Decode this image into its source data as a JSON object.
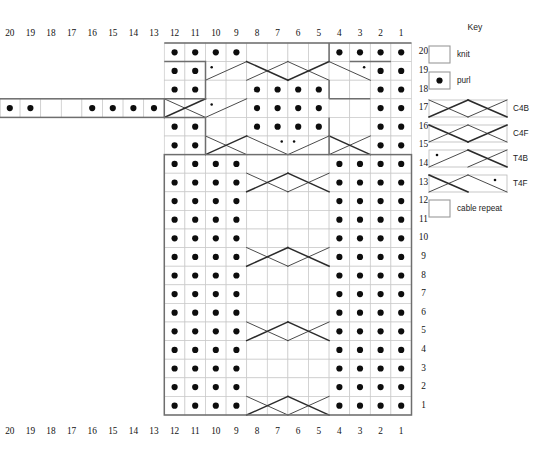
{
  "page": {
    "top_faint_text": "",
    "background": "#ffffff",
    "line_color": "#2b2b2b",
    "grid_color": "#c9c9c9",
    "outline_color": "#6e6e6e",
    "dot_color": "#0d0d0d"
  },
  "chart": {
    "cols": 20,
    "rows": 20,
    "col_labels_top": [
      "20",
      "19",
      "18",
      "17",
      "16",
      "15",
      "14",
      "13",
      "12",
      "11",
      "10",
      "9",
      "8",
      "7",
      "6",
      "5",
      "4",
      "3",
      "2",
      "1"
    ],
    "col_labels_bottom": [
      "20",
      "19",
      "18",
      "17",
      "16",
      "15",
      "14",
      "13",
      "12",
      "11",
      "10",
      "9",
      "8",
      "7",
      "6",
      "5",
      "4",
      "3",
      "2",
      "1"
    ],
    "row_labels": [
      "20",
      "19",
      "18",
      "17",
      "16",
      "15",
      "14",
      "13",
      "12",
      "11",
      "10",
      "9",
      "8",
      "7",
      "6",
      "5",
      "4",
      "3",
      "2",
      "1"
    ],
    "symbols": {
      "knit": "knit",
      "purl": "purl",
      "c4b": "C4B",
      "c4f": "C4F",
      "t4b": "T4B",
      "t4f": "T4F"
    },
    "rows_data": [
      {
        "row": "20",
        "start_col": 12,
        "end_col": 1,
        "cells": [
          "purl",
          "purl",
          "purl",
          "purl",
          "knit",
          "knit",
          "knit",
          "knit",
          "purl",
          "purl",
          "purl",
          "purl"
        ]
      },
      {
        "row": "19",
        "start_col": 12,
        "end_col": 1,
        "cells": [
          "purl",
          "purl",
          "t4b",
          "t4b",
          "c4f",
          "c4f",
          "c4b",
          "c4b",
          "t4f",
          "t4f",
          "purl",
          "purl"
        ]
      },
      {
        "row": "18",
        "start_col": 12,
        "end_col": 1,
        "cells": [
          "purl",
          "purl",
          "knit",
          "knit",
          "purl",
          "purl",
          "purl",
          "purl",
          "knit",
          "knit",
          "purl",
          "purl"
        ]
      },
      {
        "row": "17",
        "start_col": 20,
        "end_col": 1,
        "cells": [
          "purl",
          "purl",
          "knit",
          "knit",
          "purl",
          "purl",
          "purl",
          "purl",
          "c4b",
          "c4b",
          "t4b",
          "t4b",
          "purl",
          "purl",
          "purl",
          "purl",
          "knit",
          "knit",
          "purl",
          "purl"
        ]
      },
      {
        "row": "16",
        "start_col": 12,
        "end_col": 1,
        "cells": [
          "purl",
          "purl",
          "knit",
          "knit",
          "purl",
          "purl",
          "purl",
          "purl",
          "knit",
          "knit",
          "purl",
          "purl"
        ]
      },
      {
        "row": "15",
        "start_col": 12,
        "end_col": 1,
        "cells": [
          "purl",
          "purl",
          "c4b",
          "c4b",
          "t4f",
          "t4f",
          "t4b",
          "t4b",
          "c4f",
          "c4f",
          "purl",
          "purl"
        ]
      },
      {
        "row": "14",
        "start_col": 12,
        "end_col": 1,
        "cells": [
          "purl",
          "purl",
          "purl",
          "purl",
          "knit",
          "knit",
          "knit",
          "knit",
          "purl",
          "purl",
          "purl",
          "purl"
        ]
      },
      {
        "row": "13",
        "start_col": 12,
        "end_col": 1,
        "cells": [
          "purl",
          "purl",
          "purl",
          "purl",
          "c4b",
          "c4b",
          "c4f",
          "c4f",
          "purl",
          "purl",
          "purl",
          "purl"
        ]
      },
      {
        "row": "12",
        "start_col": 12,
        "end_col": 1,
        "cells": [
          "purl",
          "purl",
          "purl",
          "purl",
          "knit",
          "knit",
          "knit",
          "knit",
          "purl",
          "purl",
          "purl",
          "purl"
        ]
      },
      {
        "row": "11",
        "start_col": 12,
        "end_col": 1,
        "cells": [
          "purl",
          "purl",
          "purl",
          "purl",
          "knit",
          "knit",
          "knit",
          "knit",
          "purl",
          "purl",
          "purl",
          "purl"
        ]
      },
      {
        "row": "10",
        "start_col": 12,
        "end_col": 1,
        "cells": [
          "purl",
          "purl",
          "purl",
          "purl",
          "knit",
          "knit",
          "knit",
          "knit",
          "purl",
          "purl",
          "purl",
          "purl"
        ]
      },
      {
        "row": "9",
        "start_col": 12,
        "end_col": 1,
        "cells": [
          "purl",
          "purl",
          "purl",
          "purl",
          "c4b",
          "c4b",
          "c4f",
          "c4f",
          "purl",
          "purl",
          "purl",
          "purl"
        ]
      },
      {
        "row": "8",
        "start_col": 12,
        "end_col": 1,
        "cells": [
          "purl",
          "purl",
          "purl",
          "purl",
          "knit",
          "knit",
          "knit",
          "knit",
          "purl",
          "purl",
          "purl",
          "purl"
        ]
      },
      {
        "row": "7",
        "start_col": 12,
        "end_col": 1,
        "cells": [
          "purl",
          "purl",
          "purl",
          "purl",
          "knit",
          "knit",
          "knit",
          "knit",
          "purl",
          "purl",
          "purl",
          "purl"
        ]
      },
      {
        "row": "6",
        "start_col": 12,
        "end_col": 1,
        "cells": [
          "purl",
          "purl",
          "purl",
          "purl",
          "knit",
          "knit",
          "knit",
          "knit",
          "purl",
          "purl",
          "purl",
          "purl"
        ]
      },
      {
        "row": "5",
        "start_col": 12,
        "end_col": 1,
        "cells": [
          "purl",
          "purl",
          "purl",
          "purl",
          "c4b",
          "c4b",
          "c4f",
          "c4f",
          "purl",
          "purl",
          "purl",
          "purl"
        ]
      },
      {
        "row": "4",
        "start_col": 12,
        "end_col": 1,
        "cells": [
          "purl",
          "purl",
          "purl",
          "purl",
          "knit",
          "knit",
          "knit",
          "knit",
          "purl",
          "purl",
          "purl",
          "purl"
        ]
      },
      {
        "row": "3",
        "start_col": 12,
        "end_col": 1,
        "cells": [
          "purl",
          "purl",
          "purl",
          "purl",
          "knit",
          "knit",
          "knit",
          "knit",
          "purl",
          "purl",
          "purl",
          "purl"
        ]
      },
      {
        "row": "2",
        "start_col": 12,
        "end_col": 1,
        "cells": [
          "purl",
          "purl",
          "purl",
          "purl",
          "knit",
          "knit",
          "knit",
          "knit",
          "purl",
          "purl",
          "purl",
          "purl"
        ]
      },
      {
        "row": "1",
        "start_col": 12,
        "end_col": 1,
        "cells": [
          "purl",
          "purl",
          "purl",
          "purl",
          "c4b",
          "c4b",
          "c4f",
          "c4f",
          "purl",
          "purl",
          "purl",
          "purl"
        ]
      }
    ]
  },
  "key": {
    "title": "Key",
    "items": [
      {
        "id": "knit",
        "label": "knit",
        "type": "single"
      },
      {
        "id": "purl",
        "label": "purl",
        "type": "single"
      },
      {
        "id": "c4b",
        "label": "C4B",
        "type": "cable"
      },
      {
        "id": "c4f",
        "label": "C4F",
        "type": "cable"
      },
      {
        "id": "t4b",
        "label": "T4B",
        "type": "cable"
      },
      {
        "id": "t4f",
        "label": "T4F",
        "type": "cable"
      },
      {
        "id": "cable_repeat",
        "label": "cable repeat",
        "type": "single"
      }
    ]
  }
}
